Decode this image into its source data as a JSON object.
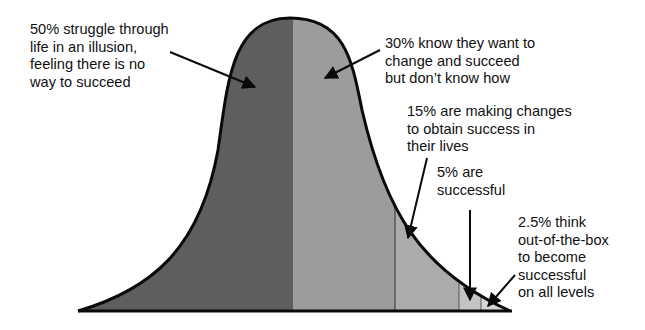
{
  "diagram": {
    "type": "bell-curve-segmented",
    "segments": [
      {
        "id": "struggle",
        "percent": "50%",
        "fill": "#5e5e5e"
      },
      {
        "id": "know-want",
        "percent": "30%",
        "fill": "#9c9c9c"
      },
      {
        "id": "making-changes",
        "percent": "15%",
        "fill": "#ababab"
      },
      {
        "id": "successful",
        "percent": "5%",
        "fill": "#c4c4c4"
      },
      {
        "id": "out-of-box",
        "percent": "2.5%",
        "fill": "#d6d6d6"
      }
    ],
    "labels": [
      {
        "id": "struggle",
        "text": "50% struggle through\nlife in an illusion,\nfeeling there is no\nway to succeed"
      },
      {
        "id": "know-want",
        "text": "30% know they want to\nchange and succeed\nbut don’t know how"
      },
      {
        "id": "making-changes",
        "text": "15% are making changes\nto obtain success in\ntheir lives"
      },
      {
        "id": "successful",
        "text": "5% are\nsuccessful"
      },
      {
        "id": "out-of-box",
        "text": "2.5% think\nout-of-the-box\nto become\nsuccessful\non all levels"
      }
    ],
    "colors": {
      "outline": "#0a0a0a",
      "background": "#ffffff"
    }
  }
}
